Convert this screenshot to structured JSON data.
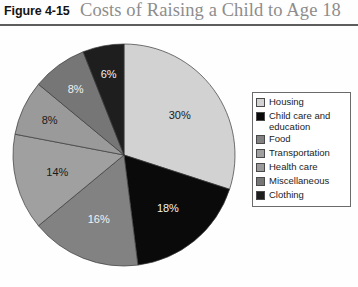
{
  "header": {
    "figure_number": "Figure 4-15",
    "title": "Costs of Raising a Child to Age 18"
  },
  "legend": {
    "items": [
      {
        "label": "Housing",
        "color": "#d2d2d2"
      },
      {
        "label": "Child care and education",
        "color": "#0a0a0a"
      },
      {
        "label": "Food",
        "color": "#828282"
      },
      {
        "label": "Transportation",
        "color": "#a0a0a0"
      },
      {
        "label": "Health care",
        "color": "#9a9a9a"
      },
      {
        "label": "Miscellaneous",
        "color": "#767676"
      },
      {
        "label": "Clothing",
        "color": "#1e1e1e"
      }
    ]
  },
  "pie": {
    "labels": {
      "housing": "30%",
      "childcare": "18%",
      "food": "16%",
      "transportation": "14%",
      "healthcare": "8%",
      "miscellaneous": "8%",
      "clothing": "6%"
    }
  },
  "chart_data": {
    "type": "pie",
    "title": "Costs of Raising a Child to Age 18",
    "xlabel": "",
    "ylabel": "",
    "legend_position": "right",
    "grid": false,
    "start_angle_deg": 0,
    "direction": "clockwise",
    "categories": [
      "Housing",
      "Child care and education",
      "Food",
      "Transportation",
      "Health care",
      "Miscellaneous",
      "Clothing"
    ],
    "values": [
      30,
      18,
      16,
      14,
      8,
      8,
      6
    ],
    "value_labels": [
      "30%",
      "18%",
      "16%",
      "14%",
      "8%",
      "8%",
      "6%"
    ],
    "colors": [
      "#d2d2d2",
      "#0a0a0a",
      "#828282",
      "#a0a0a0",
      "#9a9a9a",
      "#767676",
      "#1e1e1e"
    ],
    "units": "percent",
    "total": 100
  }
}
